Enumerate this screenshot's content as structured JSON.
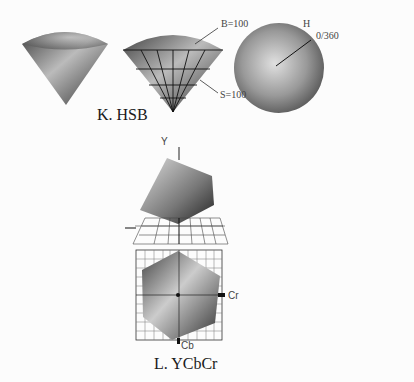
{
  "figures": {
    "hsb": {
      "caption": "K. HSB",
      "labels": {
        "brightness": "B=100",
        "saturation": "S=100",
        "hue": "H",
        "hue_range": "0/360"
      }
    },
    "ycbcr": {
      "caption": "L. YCbCr",
      "labels": {
        "y_axis": "Y",
        "cr_axis": "Cr",
        "cb_axis": "Cb"
      }
    }
  }
}
